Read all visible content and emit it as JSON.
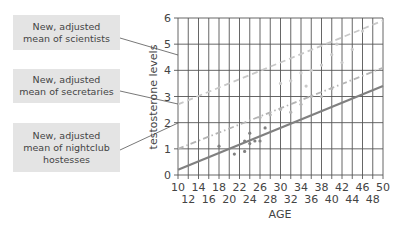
{
  "callouts": [
    {
      "label": "New, adjusted mean of scientists",
      "line1": "New, adjusted",
      "line2": "mean of scientists",
      "line3": ""
    },
    {
      "label": "New, adjusted mean of secretaries",
      "line1": "New, adjusted",
      "line2": "mean of secretaries",
      "line3": ""
    },
    {
      "label": "New, adjusted mean of nightclub hostesses",
      "line1": "New, adjusted",
      "line2": "mean of nightclub",
      "line3": "hostesses"
    }
  ],
  "chart_data": {
    "type": "scatter",
    "title": "",
    "xlabel": "AGE",
    "ylabel": "testosterone levels",
    "xlim": [
      10,
      50
    ],
    "ylim": [
      0,
      6
    ],
    "grid": true,
    "x_ticks_row1": [
      "10",
      "14",
      "18",
      "22",
      "26",
      "30",
      "34",
      "38",
      "42",
      "46",
      "50"
    ],
    "x_ticks_row2": [
      "12",
      "16",
      "20",
      "24",
      "28",
      "32",
      "36",
      "40",
      "44",
      "48"
    ],
    "y_ticks": [
      "0",
      "1",
      "2",
      "3",
      "4",
      "5",
      "6"
    ],
    "series": [
      {
        "name": "New, adjusted mean of scientists",
        "style": "dashed",
        "color": "#c8c8c8",
        "line": {
          "x": [
            10,
            50
          ],
          "y": [
            2.7,
            5.9
          ]
        },
        "points": {
          "x": [
            30,
            32,
            34,
            35,
            36,
            38,
            40,
            41,
            42,
            44,
            46
          ],
          "y": [
            3.5,
            3.6,
            3.9,
            3.4,
            4.0,
            4.2,
            4.6,
            5.0,
            4.3,
            4.8,
            5.5
          ]
        }
      },
      {
        "name": "New, adjusted mean of secretaries",
        "style": "dash-dot",
        "color": "#b4b4b4",
        "line": {
          "x": [
            10,
            50
          ],
          "y": [
            1.0,
            4.1
          ]
        },
        "points": {
          "x": [
            26,
            28,
            30,
            32,
            34,
            36,
            38,
            40
          ],
          "y": [
            2.2,
            2.3,
            2.5,
            2.4,
            2.7,
            3.0,
            3.0,
            3.3
          ]
        }
      },
      {
        "name": "New, adjusted mean of nightclub hostesses",
        "style": "solid",
        "color": "#808080",
        "line": {
          "x": [
            10,
            50
          ],
          "y": [
            0.2,
            3.4
          ]
        },
        "points": {
          "x": [
            18,
            21,
            23,
            23,
            24,
            24,
            25,
            26,
            27
          ],
          "y": [
            1.1,
            0.8,
            0.9,
            1.3,
            1.2,
            1.6,
            1.3,
            1.3,
            1.8
          ]
        }
      }
    ]
  }
}
